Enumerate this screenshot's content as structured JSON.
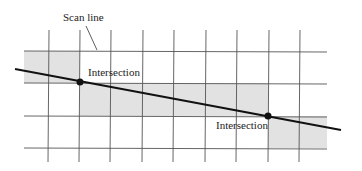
{
  "diagram": {
    "labels": {
      "scan_line": "Scan line",
      "intersection_1": "Intersection",
      "intersection_2": "Intersection"
    },
    "colors": {
      "grid": "#555555",
      "shade": "#e2e2e2",
      "line": "#111111",
      "text": "#222222"
    }
  }
}
